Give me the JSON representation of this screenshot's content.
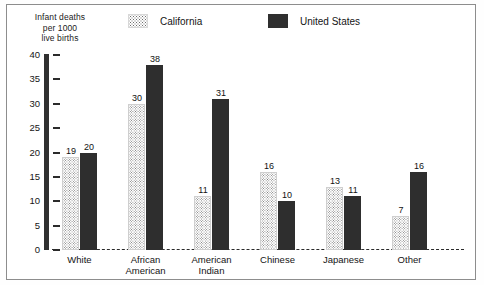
{
  "chart_data": {
    "type": "bar",
    "title": "",
    "subtitle": "",
    "ylabel_lines": [
      "Infant deaths",
      "per 1000",
      "live births"
    ],
    "xlabel": "",
    "categories": [
      "White",
      "African American",
      "American Indian",
      "Chinese",
      "Japanese",
      "Other"
    ],
    "category_label_lines": [
      [
        "White"
      ],
      [
        "African",
        "American"
      ],
      [
        "American",
        "Indian"
      ],
      [
        "Chinese"
      ],
      [
        "Japanese"
      ],
      [
        "Other"
      ]
    ],
    "series": [
      {
        "name": "California",
        "values": [
          19,
          30,
          11,
          16,
          13,
          7
        ],
        "color": "#ffffff",
        "pattern": "stipple"
      },
      {
        "name": "United States",
        "values": [
          20,
          38,
          31,
          10,
          11,
          16
        ],
        "color": "#2e2e2e",
        "pattern": "solid"
      }
    ],
    "ylim": [
      0,
      40
    ],
    "yticks": [
      0,
      5,
      10,
      15,
      20,
      25,
      30,
      35,
      40
    ],
    "ytick_labels": [
      "0",
      "5",
      "10",
      "15",
      "20",
      "25",
      "30",
      "35",
      "40"
    ],
    "grid": false,
    "legend_position": "top",
    "baseline_style": "dashed"
  },
  "legend": {
    "items": [
      {
        "label": "California",
        "swatch": "stipple-swatch"
      },
      {
        "label": "United States",
        "swatch": "solid-dark-swatch"
      }
    ]
  },
  "colors": {
    "series_us": "#2e2e2e",
    "series_ca": "#ffffff",
    "axis": "#303030",
    "frame": "#8d8d8d",
    "text": "#141414"
  }
}
